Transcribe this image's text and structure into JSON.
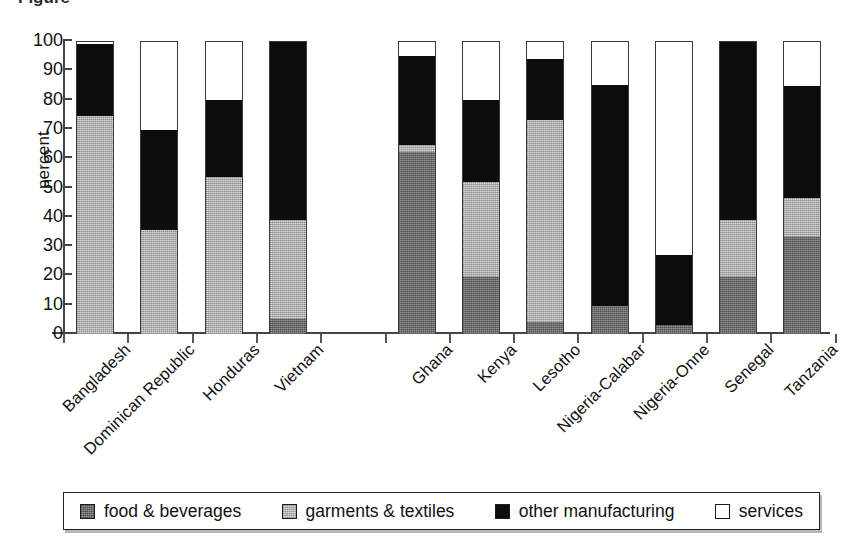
{
  "title_fragment": "Figure",
  "chart_data": {
    "type": "bar",
    "subtype": "stacked-bar-100",
    "title": "",
    "xlabel": "",
    "ylabel": "percent",
    "ylim": [
      0,
      100
    ],
    "yticks": [
      0,
      10,
      20,
      30,
      40,
      50,
      60,
      70,
      80,
      90,
      100
    ],
    "ytick_labels": [
      "0",
      "10",
      "20",
      "30",
      "40",
      "50",
      "60",
      "70",
      "80",
      "90",
      "100"
    ],
    "grid": false,
    "legend_position": "bottom",
    "categories": [
      "Bangladesh",
      "Dominican Republic",
      "Honduras",
      "Vietnam",
      "",
      "Ghana",
      "Kenya",
      "Lesotho",
      "Nigeria-Calabar",
      "Nigeria-Onne",
      "Senegal",
      "Tanzania"
    ],
    "series": [
      {
        "name": "food & beverages",
        "color": "#7d7d7d",
        "values": [
          0,
          0,
          0,
          5,
          null,
          62,
          19.5,
          4,
          9.5,
          3,
          19.5,
          33
        ]
      },
      {
        "name": "garments & textiles",
        "color": "#c0c0c0",
        "values": [
          74.5,
          35.5,
          53.5,
          34,
          null,
          2.5,
          32.5,
          69,
          0,
          0,
          19.5,
          13.5
        ]
      },
      {
        "name": "other manufacturing",
        "color": "#0d0d0d",
        "values": [
          24.5,
          34,
          26.5,
          61,
          null,
          30.5,
          28,
          21,
          75.5,
          24,
          60.5,
          38
        ]
      },
      {
        "name": "services",
        "color": "#ffffff",
        "values": [
          1,
          30.5,
          20,
          0,
          null,
          5,
          20,
          6,
          15,
          73,
          0.5,
          15.5
        ]
      }
    ],
    "cumulative_tops": [
      {
        "category": "Bangladesh",
        "food": 0,
        "garments": 74.5,
        "other": 99,
        "services": 100
      },
      {
        "category": "Dominican Republic",
        "food": 0,
        "garments": 35.5,
        "other": 69.5,
        "services": 100
      },
      {
        "category": "Honduras",
        "food": 0,
        "garments": 53.5,
        "other": 80,
        "services": 100
      },
      {
        "category": "Vietnam",
        "food": 5,
        "garments": 39,
        "other": 100,
        "services": 100
      },
      {
        "category": "Ghana",
        "food": 62,
        "garments": 64.5,
        "other": 95,
        "services": 100
      },
      {
        "category": "Kenya",
        "food": 19.5,
        "garments": 52,
        "other": 80,
        "services": 100
      },
      {
        "category": "Lesotho",
        "food": 4,
        "garments": 73,
        "other": 94,
        "services": 100
      },
      {
        "category": "Nigeria-Calabar",
        "food": 9.5,
        "garments": 9.5,
        "other": 85,
        "services": 100
      },
      {
        "category": "Nigeria-Onne",
        "food": 3,
        "garments": 3,
        "other": 27,
        "services": 100
      },
      {
        "category": "Senegal",
        "food": 19.5,
        "garments": 39,
        "other": 99.5,
        "services": 100
      },
      {
        "category": "Tanzania",
        "food": 33,
        "garments": 46.5,
        "other": 84.5,
        "services": 100
      }
    ]
  },
  "legend": {
    "items": [
      {
        "label": "food & beverages",
        "swatch": "food"
      },
      {
        "label": "garments & textiles",
        "swatch": "garments"
      },
      {
        "label": "other manufacturing",
        "swatch": "other"
      },
      {
        "label": "services",
        "swatch": "services"
      }
    ]
  }
}
